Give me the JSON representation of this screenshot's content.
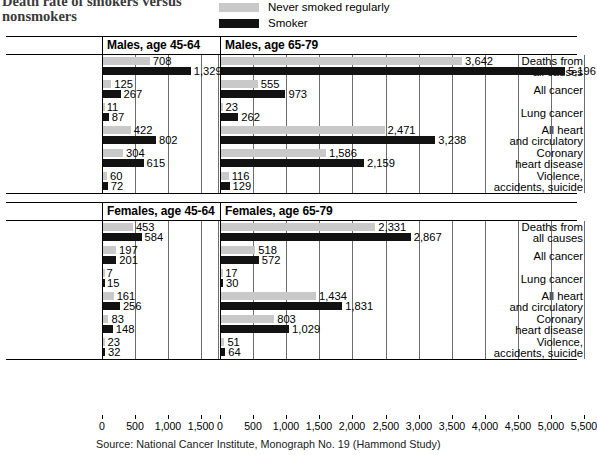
{
  "title": "Death rate of smokers versus nonsmokers",
  "legend": {
    "never": {
      "label": "Never smoked regularly",
      "color": "#c9c9c9"
    },
    "smoker": {
      "label": "Smoker",
      "color": "#121212"
    }
  },
  "source": "Source: National Cancer Institute, Monograph No. 19 (Hammond Study)",
  "axis": {
    "left_ticks": [
      "0",
      "500",
      "1,000",
      "1,500"
    ],
    "right_ticks": [
      "0",
      "500",
      "1,000",
      "1,500",
      "2,000",
      "2,500",
      "3,000",
      "3,500",
      "4,000",
      "4,500",
      "5,000",
      "5,500"
    ]
  },
  "panels": {
    "males_45": "Males, age 45-64",
    "males_65": "Males, age 65-79",
    "females_45": "Females, age 45-64",
    "females_65": "Females, age 65-79"
  },
  "categories": [
    [
      "Deaths from",
      "all causes"
    ],
    [
      "All cancer"
    ],
    [
      "Lung cancer"
    ],
    [
      "All heart",
      "and circulatory"
    ],
    [
      "Coronary",
      "heart disease"
    ],
    [
      "Violence,",
      "accidents, suicide"
    ]
  ],
  "chart_data": {
    "type": "bar",
    "title": "Death rate of smokers versus nonsmokers",
    "xlabel": "",
    "ylabel": "",
    "grid": true,
    "legend_position": "top-right",
    "orientation": "horizontal",
    "categories": [
      "Deaths from all causes",
      "All cancer",
      "Lung cancer",
      "All heart and circulatory",
      "Coronary heart disease",
      "Violence, accidents, suicide"
    ],
    "panels": [
      {
        "name": "Males, age 45-64",
        "xlim": [
          0,
          1750
        ],
        "xticks": [
          0,
          500,
          1000,
          1500
        ],
        "series": [
          {
            "name": "Never smoked regularly",
            "values": [
              708,
              125,
              11,
              422,
              304,
              60
            ],
            "labels": [
              "708",
              "125",
              "11",
              "422",
              "304",
              "60"
            ]
          },
          {
            "name": "Smoker",
            "values": [
              1329,
              267,
              87,
              802,
              615,
              72
            ],
            "labels": [
              "1,329",
              "267",
              "87",
              "802",
              "615",
              "72"
            ]
          }
        ]
      },
      {
        "name": "Males, age 65-79",
        "xlim": [
          0,
          5500
        ],
        "xticks": [
          0,
          500,
          1000,
          1500,
          2000,
          2500,
          3000,
          3500,
          4000,
          4500,
          5000,
          5500
        ],
        "series": [
          {
            "name": "Never smoked regularly",
            "values": [
              3642,
              555,
              23,
              2471,
              1586,
              116
            ],
            "labels": [
              "3,642",
              "555",
              "23",
              "2,471",
              "1,586",
              "116"
            ]
          },
          {
            "name": "Smoker",
            "values": [
              5196,
              973,
              262,
              3238,
              2159,
              129
            ],
            "labels": [
              "5,196",
              "973",
              "262",
              "3,238",
              "2,159",
              "129"
            ]
          }
        ]
      },
      {
        "name": "Females, age 45-64",
        "xlim": [
          0,
          1750
        ],
        "xticks": [
          0,
          500,
          1000,
          1500
        ],
        "series": [
          {
            "name": "Never smoked regularly",
            "values": [
              453,
              197,
              7,
              161,
              83,
              23
            ],
            "labels": [
              "453",
              "197",
              "7",
              "161",
              "83",
              "23"
            ]
          },
          {
            "name": "Smoker",
            "values": [
              584,
              201,
              15,
              256,
              148,
              32
            ],
            "labels": [
              "584",
              "201",
              "15",
              "256",
              "148",
              "32"
            ]
          }
        ]
      },
      {
        "name": "Females, age 65-79",
        "xlim": [
          0,
          5500
        ],
        "xticks": [
          0,
          500,
          1000,
          1500,
          2000,
          2500,
          3000,
          3500,
          4000,
          4500,
          5000,
          5500
        ],
        "series": [
          {
            "name": "Never smoked regularly",
            "values": [
              2331,
              518,
              17,
              1434,
              803,
              51
            ],
            "labels": [
              "2,331",
              "518",
              "17",
              "1,434",
              "803",
              "51"
            ]
          },
          {
            "name": "Smoker",
            "values": [
              2867,
              572,
              30,
              1831,
              1029,
              64
            ],
            "labels": [
              "2,867",
              "572",
              "30",
              "1,831",
              "1,029",
              "64"
            ]
          }
        ]
      }
    ],
    "source": "Source: National Cancer Institute, Monograph No. 19 (Hammond Study)"
  }
}
